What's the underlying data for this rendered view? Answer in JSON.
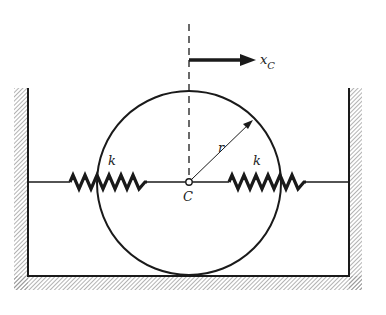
{
  "diagram": {
    "labels": {
      "displacement": "x",
      "displacement_sub": "C",
      "radius": "r",
      "spring_left": "k",
      "spring_right": "k",
      "center": "C"
    },
    "colors": {
      "ink": "#1a1a1a",
      "hatch": "#8a8a8a",
      "background": "#ffffff"
    },
    "geometry": {
      "center": [
        189,
        182
      ],
      "radius": 92,
      "left_wall_x": 28,
      "right_wall_x": 349,
      "floor_y": 276
    }
  }
}
